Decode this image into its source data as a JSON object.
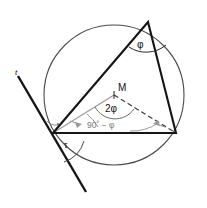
{
  "figure": {
    "type": "geometry-diagram",
    "canvas": {
      "width": 207,
      "height": 208,
      "background": "#ffffff"
    },
    "colors": {
      "stroke_dark": "#1a1a1a",
      "stroke_circle": "#444444",
      "stroke_gray": "#999999",
      "label_dark": "#111111",
      "label_gray": "#777777"
    },
    "labels": {
      "tangent_line": "t",
      "center_point": "M",
      "inscribed_angle": "φ",
      "central_angle": "2φ",
      "base_angle": "90˚ − φ",
      "tangent_chord_angle": "τ"
    },
    "points": {
      "center": {
        "name": "M",
        "x": 114,
        "y": 95
      },
      "vertex_top": {
        "x": 148,
        "y": 22
      },
      "vertex_left": {
        "x": 53,
        "y": 133
      },
      "vertex_right": {
        "x": 176,
        "y": 133
      }
    },
    "circle": {
      "cx": 114,
      "cy": 95,
      "r": 70
    },
    "tangent": {
      "x1": 18,
      "y1": 76,
      "x2": 86,
      "y2": 192
    },
    "elements": [
      "circumscribed-circle",
      "inscribed-triangle",
      "tangent-line",
      "radius-to-left-vertex",
      "radius-to-right-vertex-dashed",
      "inscribed-angle-arc",
      "central-angle-arc",
      "base-angle-arc",
      "tangent-chord-angle-arc",
      "right-angle-mark"
    ]
  }
}
